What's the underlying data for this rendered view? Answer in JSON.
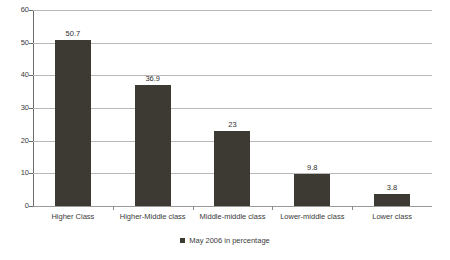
{
  "chart_data": {
    "type": "bar",
    "title": "",
    "subtitle": "",
    "xlabel": "",
    "ylabel": "",
    "categories": [
      "Higher Class",
      "Higher-Middle class",
      "Middle-middle class",
      "Lower-middle class",
      "Lower class"
    ],
    "series": [
      {
        "name": "May 2006 in percentage",
        "values": [
          50.7,
          36.9,
          23,
          9.8,
          3.8
        ],
        "value_labels": [
          "50.7",
          "36.9",
          "23",
          "9.8",
          "3.8"
        ],
        "color": "#3d3a33"
      }
    ],
    "ylim": [
      0,
      60
    ],
    "ytick_labels": [
      "60",
      "50",
      "40",
      "30",
      "20",
      "10",
      "0"
    ],
    "ytick_values": [
      60,
      50,
      40,
      30,
      20,
      10,
      0
    ],
    "grid": true,
    "grid_axis": "y",
    "legend": {
      "position": "bottom",
      "entries": [
        {
          "label": "May 2006 in percentage",
          "swatch": "legend-swatch-icon",
          "color": "#3d3a33"
        }
      ]
    }
  },
  "colors": {
    "bar": "#3d3a33",
    "gridline": "#b9b9b9",
    "axis": "#6b6b6b",
    "text": "#3a3a3a",
    "background": "#ffffff"
  }
}
